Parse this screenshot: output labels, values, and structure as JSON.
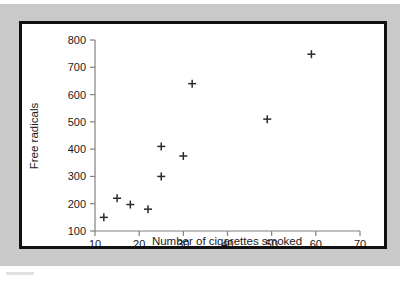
{
  "figure": {
    "background_color": "#c9c9c9",
    "card_color": "#ffffff",
    "frame_color": "#111111",
    "axis_color": "#808080",
    "marker_color": "#2b2b2b"
  },
  "chart_data": {
    "type": "scatter",
    "title": "",
    "xlabel": "Number of cigarettes smoked",
    "ylabel": "Free radicals",
    "xlim": [
      10,
      70
    ],
    "ylim": [
      100,
      800
    ],
    "xticks": [
      10,
      20,
      30,
      40,
      50,
      60,
      70
    ],
    "yticks": [
      100,
      200,
      300,
      400,
      500,
      600,
      700,
      800
    ],
    "xtick_labels": [
      "10",
      "20",
      "30",
      "40",
      "50",
      "60",
      "70"
    ],
    "ytick_labels": [
      "100",
      "200",
      "300",
      "400",
      "500",
      "600",
      "700",
      "800"
    ],
    "grid": false,
    "legend": null,
    "marker_style": "plus",
    "x": [
      12,
      15,
      18,
      22,
      25,
      25,
      30,
      32,
      49,
      59
    ],
    "y": [
      150,
      220,
      197,
      180,
      300,
      410,
      375,
      640,
      510,
      748
    ],
    "points": [
      {
        "x": 12,
        "y": 150
      },
      {
        "x": 15,
        "y": 220
      },
      {
        "x": 18,
        "y": 197
      },
      {
        "x": 22,
        "y": 180
      },
      {
        "x": 25,
        "y": 300
      },
      {
        "x": 25,
        "y": 410
      },
      {
        "x": 30,
        "y": 375
      },
      {
        "x": 32,
        "y": 640
      },
      {
        "x": 49,
        "y": 510
      },
      {
        "x": 59,
        "y": 748
      }
    ]
  }
}
